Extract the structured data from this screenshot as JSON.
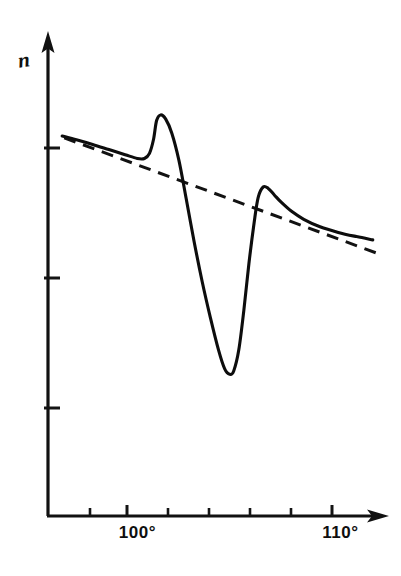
{
  "figure": {
    "kind": "hand-drawn-line-plot",
    "background_color": "#ffffff",
    "ink_color": "#111111"
  },
  "axes": {
    "y_axis_label": "n",
    "y_axis_name": "refractive-index-axis",
    "x_axis_name": "temperature-axis",
    "x_tick_label_left": "100°",
    "x_tick_label_right": "110°"
  },
  "chart_data": {
    "type": "line",
    "title": "",
    "subtitle": "",
    "xlabel": "",
    "ylabel": "n",
    "xlim": [
      95.6,
      112.4
    ],
    "ylim": [
      0.0,
      1.0
    ],
    "grid": false,
    "legend_position": "none",
    "x_tick_labels": [
      "100°",
      "110°"
    ],
    "x_labeled_ticks": [
      100,
      110
    ],
    "x_minor_ticks": [
      98,
      100,
      102,
      104,
      106,
      108,
      110
    ],
    "y_ticks": [
      0.805,
      0.575,
      0.33
    ],
    "y_tick_labels": [
      "",
      "",
      ""
    ],
    "annotations": [
      {
        "name": "first-peak",
        "x": 100.9,
        "y": 0.855,
        "note": "small pre-transition maximum"
      },
      {
        "name": "deep-minimum",
        "x": 104.6,
        "y": 0.305,
        "note": "sharp transition minimum"
      },
      {
        "name": "second-peak",
        "x": 106.5,
        "y": 0.7,
        "note": "post-transition recovery maximum"
      }
    ],
    "series": [
      {
        "name": "measured-curve",
        "style": "solid",
        "x": [
          96.3,
          97.0,
          97.8,
          98.6,
          99.4,
          100.0,
          100.35,
          100.6,
          100.8,
          100.95,
          101.15,
          101.4,
          101.7,
          102.05,
          102.4,
          102.8,
          103.2,
          103.6,
          104.0,
          104.3,
          104.55,
          104.75,
          105.0,
          105.25,
          105.5,
          105.75,
          105.95,
          106.2,
          106.45,
          106.75,
          107.1,
          107.6,
          108.2,
          109.0,
          109.9,
          110.8,
          111.6
        ],
        "y": [
          0.812,
          0.804,
          0.794,
          0.783,
          0.772,
          0.764,
          0.764,
          0.775,
          0.805,
          0.845,
          0.857,
          0.848,
          0.818,
          0.76,
          0.68,
          0.586,
          0.5,
          0.424,
          0.355,
          0.315,
          0.303,
          0.31,
          0.355,
          0.44,
          0.54,
          0.625,
          0.68,
          0.703,
          0.7,
          0.686,
          0.67,
          0.651,
          0.634,
          0.618,
          0.606,
          0.597,
          0.59
        ]
      },
      {
        "name": "baseline-extrapolation",
        "style": "dashed",
        "x": [
          96.4,
          111.9
        ],
        "y": [
          0.808,
          0.56
        ]
      }
    ]
  },
  "marks": {
    "y_axis_arrow": "arrow-up",
    "x_axis_arrow": "arrow-right"
  }
}
